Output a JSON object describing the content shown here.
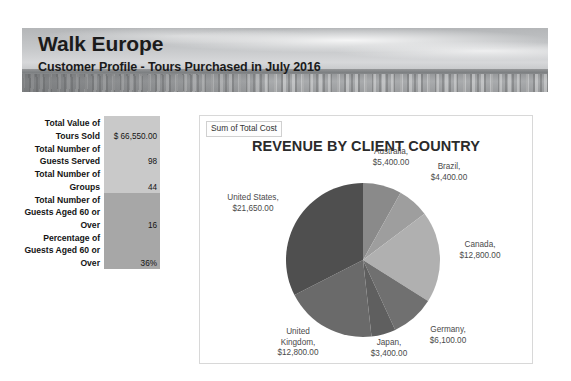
{
  "header": {
    "title": "Walk Europe",
    "subtitle": "Customer Profile - Tours Purchased in July 2016",
    "banner_image": "seascape-photo"
  },
  "metrics": {
    "rows": [
      {
        "label": "Total Value of Tours Sold",
        "value": "$ 66,550.00",
        "shade": "#c9c9c9"
      },
      {
        "label": "Total Number of Guests Served",
        "value": "98",
        "shade": "#c9c9c9"
      },
      {
        "label": "Total Number of Groups",
        "value": "44",
        "shade": "#c9c9c9"
      },
      {
        "label": "Total Number of Guests Aged 60 or Over",
        "value": "16",
        "shade": "#a7a7a7"
      },
      {
        "label": "Percentage of Guests Aged 60 or Over",
        "value": "36%",
        "shade": "#a7a7a7"
      }
    ]
  },
  "chart_panel": {
    "legend_label": "Sum of Total Cost",
    "title": "REVENUE BY CLIENT COUNTRY"
  },
  "chart_data": {
    "type": "pie",
    "title": "REVENUE BY CLIENT COUNTRY",
    "legend_title": "Sum of Total Cost",
    "legend_position": "top-left",
    "value_prefix": "$",
    "total": 66550,
    "categories": [
      "United States",
      "Australia",
      "Brazil",
      "Canada",
      "Germany",
      "Japan",
      "United Kingdom"
    ],
    "values": [
      21650,
      5400,
      4400,
      12800,
      6100,
      3400,
      12800
    ],
    "value_labels": [
      "$21,650.00",
      "$5,400.00",
      "$4,400.00",
      "$12,800.00",
      "$6,100.00",
      "$3,400.00",
      "$12,800.00"
    ],
    "colors": [
      "#4f4f4f",
      "#8a8a8a",
      "#9e9e9e",
      "#b0b0b0",
      "#707070",
      "#5f5f5f",
      "#6a6a6a"
    ],
    "slices": [
      {
        "name": "United States",
        "value": 21650,
        "label": "United States,\n$21,650.00",
        "color": "#4f4f4f",
        "percent": 32.5
      },
      {
        "name": "Australia",
        "value": 5400,
        "label": "Australia,\n$5,400.00",
        "color": "#8a8a8a",
        "percent": 8.1
      },
      {
        "name": "Brazil",
        "value": 4400,
        "label": "Brazil,\n$4,400.00",
        "color": "#9e9e9e",
        "percent": 6.6
      },
      {
        "name": "Canada",
        "value": 12800,
        "label": "Canada,\n$12,800.00",
        "color": "#b0b0b0",
        "percent": 19.2
      },
      {
        "name": "Germany",
        "value": 6100,
        "label": "Germany,\n$6,100.00",
        "color": "#707070",
        "percent": 9.2
      },
      {
        "name": "Japan",
        "value": 3400,
        "label": "Japan,\n$3,400.00",
        "color": "#5f5f5f",
        "percent": 5.1
      },
      {
        "name": "United Kingdom",
        "value": 12800,
        "label": "United\nKingdom,\n$12,800.00",
        "color": "#6a6a6a",
        "percent": 19.2
      }
    ]
  }
}
